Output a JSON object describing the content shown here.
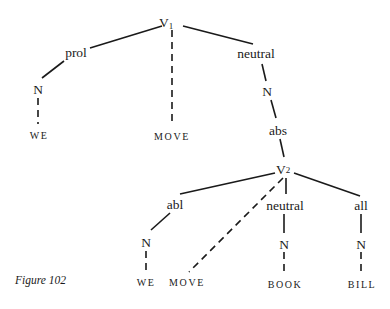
{
  "figure": {
    "caption": "Figure 102",
    "type": "case-grammar tree diagram"
  },
  "nodes": {
    "v1": {
      "label": "V",
      "subscript": "1"
    },
    "prol": {
      "label": "prol"
    },
    "n_we1": {
      "label": "N"
    },
    "we1": {
      "label": "WE"
    },
    "move1": {
      "label": "MOVE"
    },
    "neutral1": {
      "label": "neutral"
    },
    "n_abs": {
      "label": "N"
    },
    "abs": {
      "label": "abs"
    },
    "v2": {
      "label": "V",
      "subscript": "2"
    },
    "abl": {
      "label": "abl"
    },
    "n_we2": {
      "label": "N"
    },
    "we2": {
      "label": "WE"
    },
    "move2": {
      "label": "MOVE"
    },
    "neutral2": {
      "label": "neutral"
    },
    "n_book": {
      "label": "N"
    },
    "book": {
      "label": "BOOK"
    },
    "all": {
      "label": "all"
    },
    "n_bill": {
      "label": "N"
    },
    "bill": {
      "label": "BILL"
    }
  },
  "edges": [
    {
      "from": "v1",
      "to": "prol",
      "style": "solid"
    },
    {
      "from": "v1",
      "to": "move1",
      "style": "dashed"
    },
    {
      "from": "v1",
      "to": "neutral1",
      "style": "solid"
    },
    {
      "from": "prol",
      "to": "n_we1",
      "style": "solid"
    },
    {
      "from": "n_we1",
      "to": "we1",
      "style": "dashed"
    },
    {
      "from": "neutral1",
      "to": "n_abs",
      "style": "solid"
    },
    {
      "from": "n_abs",
      "to": "abs",
      "style": "solid"
    },
    {
      "from": "abs",
      "to": "v2",
      "style": "solid"
    },
    {
      "from": "v2",
      "to": "abl",
      "style": "solid"
    },
    {
      "from": "v2",
      "to": "move2",
      "style": "dashed"
    },
    {
      "from": "v2",
      "to": "neutral2",
      "style": "solid"
    },
    {
      "from": "v2",
      "to": "all",
      "style": "solid"
    },
    {
      "from": "abl",
      "to": "n_we2",
      "style": "solid"
    },
    {
      "from": "n_we2",
      "to": "we2",
      "style": "dashed"
    },
    {
      "from": "neutral2",
      "to": "n_book",
      "style": "solid"
    },
    {
      "from": "n_book",
      "to": "book",
      "style": "dashed"
    },
    {
      "from": "all",
      "to": "n_bill",
      "style": "solid"
    },
    {
      "from": "n_bill",
      "to": "bill",
      "style": "dashed"
    }
  ]
}
